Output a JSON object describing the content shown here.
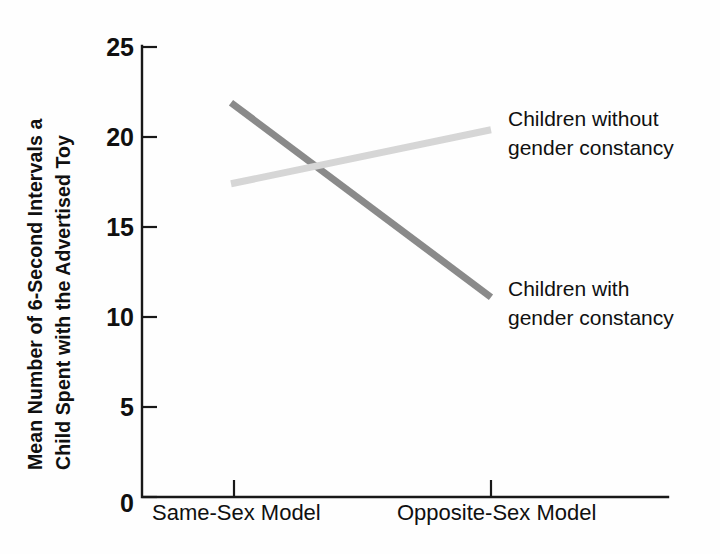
{
  "chart_data": {
    "type": "line",
    "title": "",
    "subtitle": "",
    "xlabel": "",
    "ylabel": "Mean Number of 6-Second Intervals a Child Spent with the Advertised Toy",
    "ylabel_lines": [
      "Mean Number of 6-Second Intervals a",
      "Child Spent with the Advertised Toy"
    ],
    "categories": [
      "Same-Sex Model",
      "Opposite-Sex Model"
    ],
    "yticks": [
      0,
      5,
      10,
      15,
      20,
      25
    ],
    "ytick_labels": [
      "0",
      "5",
      "10",
      "15",
      "20",
      "25"
    ],
    "ylim": [
      0,
      25
    ],
    "grid": false,
    "legend_position": "right-inline",
    "series": [
      {
        "name": "Children with gender constancy",
        "name_lines": [
          "Children with",
          "gender constancy"
        ],
        "values": [
          21.9,
          11.1
        ],
        "color": "#8a8a8a",
        "linewidth": 7
      },
      {
        "name": "Children without gender constancy",
        "name_lines": [
          "Children without",
          "gender constancy"
        ],
        "values": [
          17.4,
          20.4
        ],
        "color": "#d6d6d6",
        "linewidth": 7
      }
    ],
    "annotations": [
      {
        "text": "Children without gender constancy",
        "series": "Children without gender constancy"
      },
      {
        "text": "Children with gender constancy",
        "series": "Children with gender constancy"
      }
    ]
  },
  "axis": {
    "y_tick_0": "0",
    "y_tick_5": "5",
    "y_tick_10": "10",
    "y_tick_15": "15",
    "y_tick_20": "20",
    "y_tick_25": "25",
    "x_cat_1": "Same-Sex Model",
    "x_cat_2": "Opposite-Sex Model",
    "ylabel_line1": "Mean Number of 6-Second Intervals a",
    "ylabel_line2": "Child Spent with the Advertised Toy"
  },
  "legend": {
    "without_line1": "Children without",
    "without_line2": "gender constancy",
    "with_line1": "Children with",
    "with_line2": "gender constancy"
  },
  "colors": {
    "series_with": "#8a8a8a",
    "series_without": "#d6d6d6",
    "axis": "#181818",
    "text": "#101010",
    "background": "#fefefe"
  }
}
